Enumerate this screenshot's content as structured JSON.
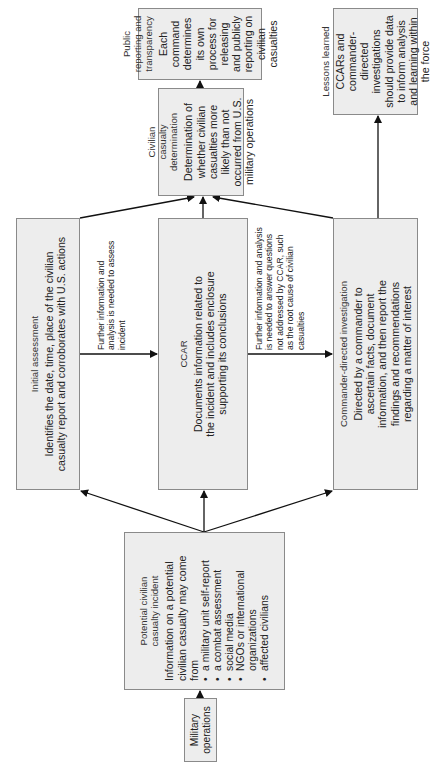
{
  "diagram": {
    "orientation": "rotated 90 degrees counter-clockwise",
    "nodes": {
      "military_operations": {
        "title": "Military operations"
      },
      "potential_incident": {
        "title": "Potential civilian casualty incident",
        "body": "Information on a potential civilian casualty may come from",
        "sources": [
          "a military unit self-report",
          "a combat assessment",
          "social media",
          "NGOs or international organizations",
          "affected civilians"
        ]
      },
      "initial_assessment": {
        "title": "Initial assessment",
        "body": "Identifies the date, time, place of the civilian casualty report and corroborates with U.S. actions"
      },
      "ccar": {
        "title": "CCAR",
        "body": "Documents information related to the incident and includes enclosure supporting its conclusions"
      },
      "commander_investigation": {
        "title": "Commander-directed investigation",
        "body": "Directed by a commander to ascertain facts, document information, and then report the findings and recommendations regarding a matter of interest"
      },
      "determination": {
        "title": "Civilian casualty determination",
        "body": "Determination of whether civilian casualties more likely than not occurred from U.S. military operations"
      },
      "public_reporting": {
        "title": "Public reporting and transparency",
        "body": "Each command determines its own process for releasing and publicly reporting on civilian casualties"
      },
      "lessons_learned": {
        "title": "Lessons learned",
        "body": "CCARs and commander-directed investigations should provide data to inform analysis and learning within the force"
      }
    },
    "edge_labels": {
      "initial_to_ccar": "Further information and analysis is needed to assess incident",
      "ccar_to_commander": "Further information and analysis is needed to answer questions not addressed by CCAR, such as the root cause of civilian casualties"
    },
    "edges": [
      [
        "military_operations",
        "potential_incident"
      ],
      [
        "potential_incident",
        "initial_assessment"
      ],
      [
        "potential_incident",
        "ccar"
      ],
      [
        "potential_incident",
        "commander_investigation"
      ],
      [
        "initial_assessment",
        "ccar"
      ],
      [
        "ccar",
        "commander_investigation"
      ],
      [
        "initial_assessment",
        "determination"
      ],
      [
        "ccar",
        "determination"
      ],
      [
        "commander_investigation",
        "determination"
      ],
      [
        "determination",
        "public_reporting"
      ],
      [
        "commander_investigation",
        "lessons_learned"
      ]
    ],
    "colors": {
      "box_fill": "#ededed",
      "box_border": "#8a8a8a",
      "text": "#222222",
      "arrow": "#111111"
    }
  }
}
